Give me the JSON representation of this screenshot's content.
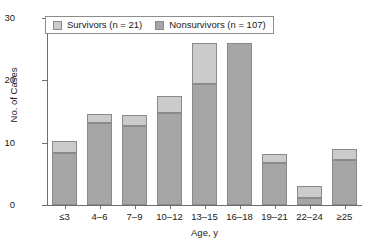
{
  "chart_data": {
    "type": "bar",
    "subtype": "stacked",
    "title": "",
    "xlabel": "Age, y",
    "ylabel": "No. of Cases",
    "categories": [
      "≤3",
      "4–6",
      "7–9",
      "10–12",
      "13–15",
      "16–18",
      "19–21",
      "22–24",
      "≥25"
    ],
    "series": [
      {
        "name": "Nonsurvivors (n = 107)",
        "legend_label": "Nonsurvivors (n = 107)",
        "color": "#a6a6a6",
        "values": [
          8.3,
          13.2,
          12.7,
          14.8,
          19.4,
          26,
          6.7,
          1.2,
          7.2
        ]
      },
      {
        "name": "Survivors (n = 21)",
        "legend_label": "Survivors (n = 21)",
        "color": "#cbcbcb",
        "values": [
          1.9,
          1.4,
          1.8,
          2.7,
          6.6,
          0,
          1.5,
          1.8,
          1.8
        ]
      }
    ],
    "totals": [
      10.2,
      14.6,
      14.5,
      17.5,
      26,
      26,
      8.2,
      3,
      9
    ],
    "ylim": [
      0,
      30
    ],
    "yticks": [
      0,
      10,
      20,
      30
    ],
    "ytick_labels": [
      "0",
      "10",
      "20",
      "30"
    ],
    "grid": false,
    "legend_position": "top-left-inside",
    "stack_order": [
      "Nonsurvivors (n = 107)",
      "Survivors (n = 21)"
    ]
  },
  "legend": {
    "items": [
      {
        "label": "Survivors (n = 21)",
        "swatch_color": "#cbcbcb"
      },
      {
        "label": "Nonsurvivors (n = 107)",
        "swatch_color": "#a6a6a6"
      }
    ]
  },
  "axes": {
    "y_title": "No. of Cases",
    "x_title": "Age, y"
  }
}
